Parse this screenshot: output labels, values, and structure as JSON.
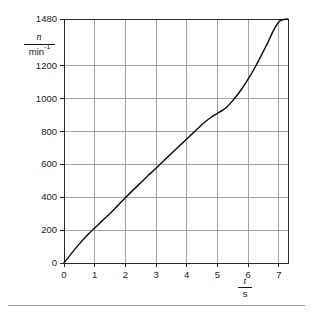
{
  "chart_data": {
    "type": "line",
    "title": "",
    "subtitle": "",
    "xlabel_numerator": "t",
    "xlabel_denominator": "s",
    "xlabel": "t/s",
    "ylabel_numerator": "n",
    "ylabel_denominator_base": "min",
    "ylabel_denominator_exp": "-1",
    "ylabel": "n/min^-1",
    "xlim": [
      0,
      7.3
    ],
    "ylim": [
      0,
      1480
    ],
    "grid": true,
    "legend": "none",
    "x_ticks": [
      0,
      1,
      2,
      3,
      4,
      5,
      6,
      7
    ],
    "x_tick_labels": [
      "0",
      "1",
      "2",
      "3",
      "4",
      "5",
      "6",
      "7"
    ],
    "y_ticks": [
      0,
      200,
      400,
      600,
      800,
      1000,
      1200,
      1480
    ],
    "y_tick_labels": [
      "0",
      "200",
      "400",
      "600",
      "800",
      "1000",
      "1200",
      "1480"
    ],
    "series": [
      {
        "name": "speed-run-up",
        "color": "#151515",
        "x": [
          0,
          0.25,
          0.5,
          0.75,
          1.0,
          1.25,
          1.5,
          1.75,
          2.0,
          2.25,
          2.5,
          2.75,
          3.0,
          3.25,
          3.5,
          3.75,
          4.0,
          4.25,
          4.5,
          4.75,
          5.0,
          5.15,
          5.3,
          5.5,
          5.75,
          6.0,
          6.25,
          6.5,
          6.65,
          6.8,
          6.9,
          7.0,
          7.1,
          7.2,
          7.3
        ],
        "values": [
          0,
          60,
          116,
          167,
          212,
          257,
          300,
          348,
          396,
          442,
          487,
          532,
          575,
          620,
          664,
          708,
          752,
          796,
          840,
          878,
          908,
          925,
          945,
          985,
          1045,
          1115,
          1195,
          1285,
          1340,
          1400,
          1435,
          1462,
          1474,
          1479,
          1480
        ]
      }
    ],
    "annotations": [],
    "asymptote_value": 1480
  },
  "figure": {
    "caption": "",
    "has_bottom_rule": true
  },
  "colors": {
    "axis": "#2b2b2b",
    "grid": "#8e8e8e",
    "curve": "#151515",
    "text": "#1b1b1b",
    "rule": "#9a9a9a",
    "background": "#ffffff"
  }
}
